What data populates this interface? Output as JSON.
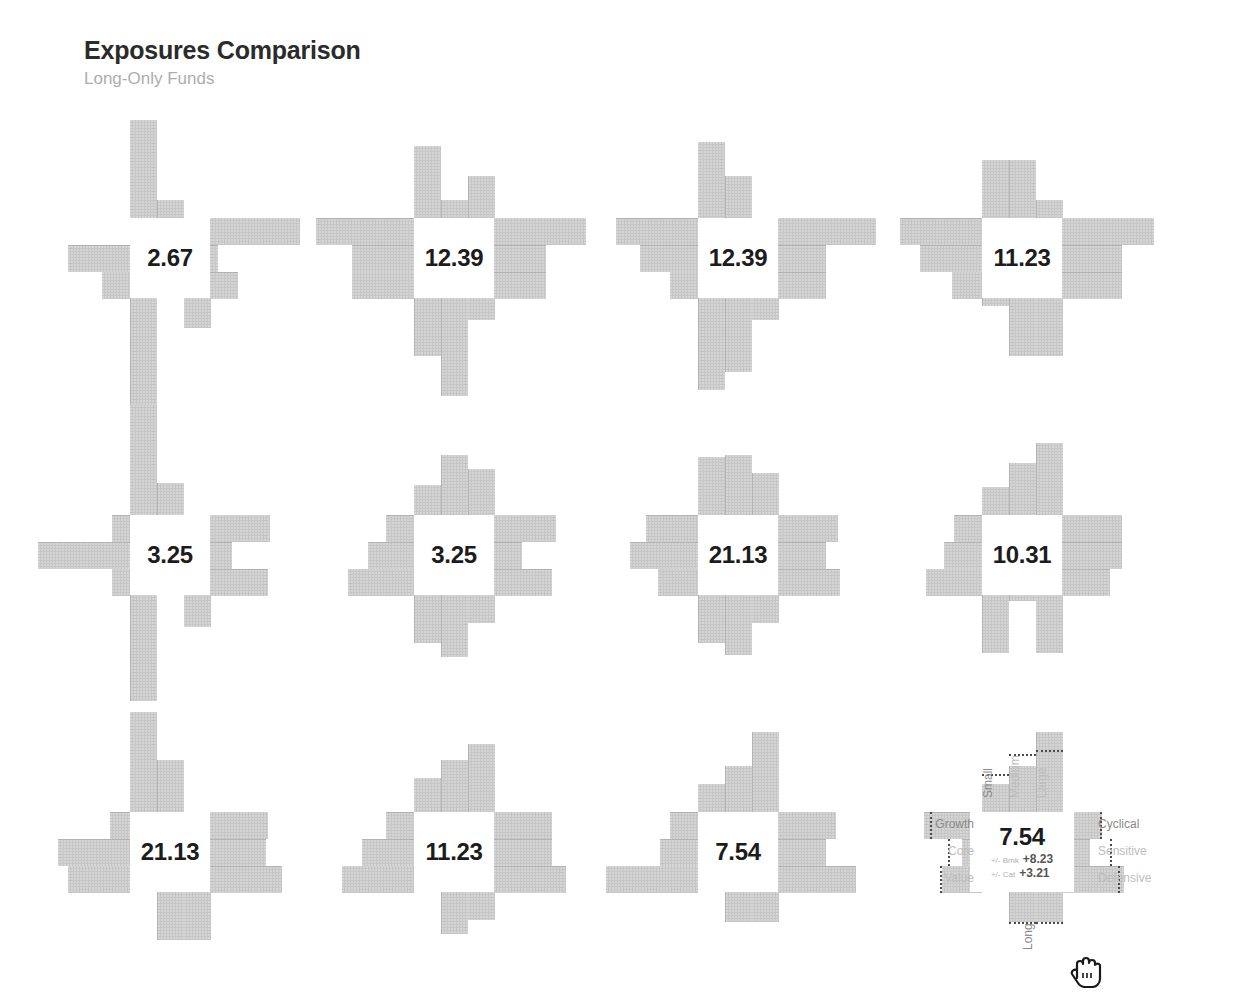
{
  "header": {
    "title": "Exposures Comparison",
    "subtitle": "Long-Only Funds"
  },
  "palette": {
    "bar": "#c6c6c6",
    "bar_separator": "#b3b3b3",
    "value_text": "#1c1c1c",
    "axis_label": "#bdbdbd",
    "axis_label_dark": "#8a8a8a",
    "reference_outline": "#4a4a4a",
    "background": "#ffffff",
    "title_text": "#2b2b2b",
    "subtitle_text": "#adadad"
  },
  "axes": {
    "top_labels": [
      "Small",
      "Medium",
      "Large"
    ],
    "left_labels": [
      "Value",
      "Core",
      "Growth"
    ],
    "right_labels": [
      "Cyclical",
      "Sensitive",
      "Defensive"
    ],
    "bottom_labels": [
      "Short",
      "Intermediate",
      "Long"
    ]
  },
  "hover": {
    "active_tile_index": 11,
    "delta_bmk_label": "+/- Bmk",
    "delta_bmk_value": "+8.23",
    "delta_cat_label": "+/- Cat",
    "delta_cat_value": "+3.21",
    "cursor_icon": "pointing-hand-cursor"
  },
  "chart_data": {
    "type": "bar",
    "title": "Exposures Comparison",
    "subtitle": "Long-Only Funds",
    "grid": {
      "rows": 3,
      "cols": 4
    },
    "arm_categories": {
      "up": [
        "Small",
        "Medium",
        "Large"
      ],
      "left": [
        "Value",
        "Core",
        "Growth"
      ],
      "right": [
        "Cyclical",
        "Sensitive",
        "Defensive"
      ],
      "down": [
        "Short",
        "Intermediate",
        "Long"
      ]
    },
    "value_unit": "",
    "tiles": [
      {
        "index": 0,
        "value": "2.67",
        "up": [
          98,
          18,
          0
        ],
        "left": [
          28,
          62,
          0
        ],
        "right": [
          90,
          8,
          28
        ],
        "down": [
          30,
          0,
          108
        ]
      },
      {
        "index": 1,
        "value": "12.39",
        "up": [
          72,
          18,
          42
        ],
        "left": [
          62,
          62,
          98
        ],
        "right": [
          92,
          52,
          52
        ],
        "down": [
          22,
          98,
          58
        ]
      },
      {
        "index": 2,
        "value": "12.39",
        "up": [
          76,
          42,
          0
        ],
        "left": [
          28,
          58,
          82
        ],
        "right": [
          98,
          48,
          48
        ],
        "down": [
          22,
          74,
          92
        ]
      },
      {
        "index": 3,
        "value": "11.23",
        "up": [
          58,
          58,
          18
        ],
        "left": [
          30,
          62,
          82
        ],
        "right": [
          92,
          60,
          60
        ],
        "down": [
          58,
          58,
          8
        ]
      },
      {
        "index": 4,
        "value": "3.25",
        "up": [
          110,
          32,
          0
        ],
        "left": [
          18,
          92,
          18
        ],
        "right": [
          60,
          22,
          58
        ],
        "down": [
          32,
          0,
          106
        ]
      },
      {
        "index": 5,
        "value": "3.25",
        "up": [
          30,
          60,
          46
        ],
        "left": [
          66,
          46,
          28
        ],
        "right": [
          62,
          28,
          58
        ],
        "down": [
          28,
          62,
          48
        ]
      },
      {
        "index": 6,
        "value": "21.13",
        "up": [
          58,
          60,
          42
        ],
        "left": [
          40,
          68,
          52
        ],
        "right": [
          60,
          48,
          62
        ],
        "down": [
          28,
          60,
          48
        ]
      },
      {
        "index": 7,
        "value": "10.31",
        "up": [
          28,
          52,
          72
        ],
        "left": [
          56,
          38,
          28
        ],
        "right": [
          60,
          60,
          48
        ],
        "down": [
          58,
          6,
          58
        ]
      },
      {
        "index": 8,
        "value": "21.13",
        "up": [
          100,
          52,
          0
        ],
        "left": [
          62,
          72,
          20
        ],
        "right": [
          58,
          56,
          72
        ],
        "down": [
          48,
          48,
          0
        ]
      },
      {
        "index": 9,
        "value": "11.23",
        "up": [
          34,
          52,
          68
        ],
        "left": [
          72,
          52,
          28
        ],
        "right": [
          58,
          58,
          72
        ],
        "down": [
          28,
          42,
          0
        ]
      },
      {
        "index": 10,
        "value": "7.54",
        "up": [
          28,
          46,
          80
        ],
        "left": [
          92,
          38,
          28
        ],
        "right": [
          58,
          48,
          78
        ],
        "down": [
          30,
          30,
          0
        ]
      },
      {
        "index": 11,
        "value": "7.54",
        "up": [
          28,
          46,
          80
        ],
        "left": [
          40,
          20,
          58
        ],
        "right": [
          40,
          28,
          62
        ],
        "down": [
          30,
          30,
          0
        ],
        "reference": {
          "up": [
            38,
            58,
            62
          ],
          "left": [
            42,
            34,
            52
          ],
          "right": [
            38,
            48,
            56
          ],
          "down": [
            30,
            30,
            0
          ]
        },
        "deltas": {
          "bmk": "+8.23",
          "cat": "+3.21"
        }
      }
    ]
  }
}
